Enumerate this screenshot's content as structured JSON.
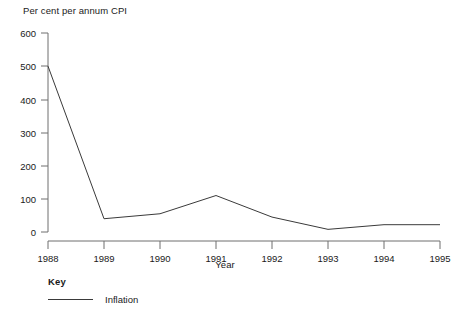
{
  "chart_data": {
    "type": "line",
    "title": "",
    "xlabel": "Year",
    "ylabel": "Per cent per annum CPI",
    "categories": [
      "1988",
      "1989",
      "1990",
      "1991",
      "1992",
      "1993",
      "1994",
      "1995"
    ],
    "x": [
      1988,
      1989,
      1990,
      1991,
      1992,
      1993,
      1994,
      1995
    ],
    "series": [
      {
        "name": "Inflation",
        "values": [
          500,
          40,
          55,
          110,
          45,
          8,
          22,
          22
        ],
        "color": "#3a3a3a"
      }
    ],
    "ylim": [
      0,
      600
    ],
    "yticks": [
      0,
      100,
      200,
      300,
      400,
      500,
      600
    ],
    "ytick_labels": [
      "0",
      "100",
      "200",
      "300",
      "400",
      "500",
      "600"
    ],
    "xtick_labels": [
      "1988",
      "1989",
      "1990",
      "1991",
      "1992",
      "1993",
      "1994",
      "1995"
    ],
    "grid": false,
    "legend_position": "below-left",
    "legend_title": "Key",
    "legend_entries": [
      {
        "label": "Inflation",
        "color": "#3a3a3a"
      }
    ],
    "axis_color": "#6e6e6e"
  },
  "legend": {
    "title": "Key",
    "entry_label": "Inflation"
  },
  "axes": {
    "y_title": "Per cent per annum CPI",
    "x_title": "Year"
  }
}
